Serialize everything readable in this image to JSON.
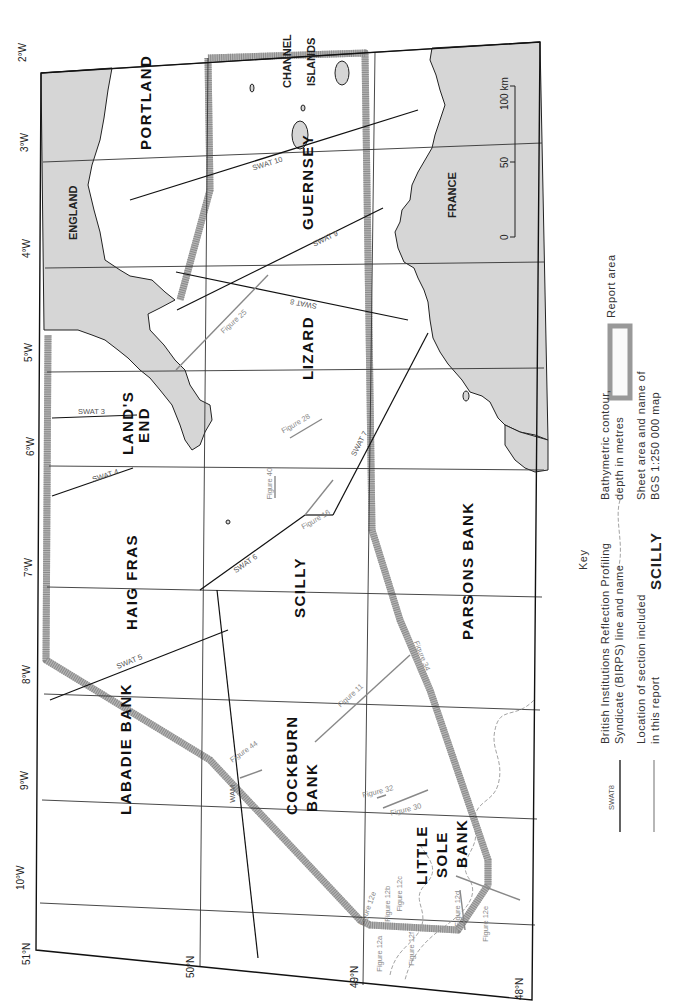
{
  "map": {
    "orientation": "rotated 90 degrees clockwise",
    "colors": {
      "land": "#d6d6d6",
      "report_area": "#b5b5b5",
      "swat_line": "#111111",
      "figure_line": "#888888",
      "contour": "#999999"
    },
    "longitude_ticks": [
      "2°W",
      "3°W",
      "4°W",
      "5°W",
      "6°W",
      "7°W",
      "8°W",
      "9°W",
      "10°W"
    ],
    "latitude_ticks": [
      "51°N",
      "50°N",
      "49°N",
      "48°N"
    ],
    "sheet_areas": [
      "PORTLAND",
      "GUERNSEY",
      "LIZARD",
      "LAND'S",
      "END",
      "HAIG FRAS",
      "SCILLY",
      "PARSONS BANK",
      "LABADIE BANK",
      "COCKBURN",
      "BANK",
      "LITTLE",
      "SOLE",
      "BANK"
    ],
    "land_labels": [
      "ENGLAND",
      "FRANCE",
      "CHANNEL",
      "ISLANDS"
    ],
    "swat_lines": [
      "SWAT 3",
      "SWAT 4",
      "SWAT 5",
      "SWAT 6",
      "SWAT 7",
      "SWAT 8",
      "SWAT 9",
      "SWAT 10",
      "WAM"
    ],
    "figure_lines": [
      "Figure 11",
      "Figure 12a",
      "Figure 12b",
      "Figure 12c",
      "Figure 12d",
      "Figure 12e",
      "Figure 12f",
      "Figure 16",
      "Figure 25",
      "Figure 27",
      "Figure 28",
      "Figure 30",
      "Figure 32",
      "Figure 34",
      "Figure 40",
      "Figure 44"
    ],
    "scale_bar": {
      "labels": [
        "0",
        "50",
        "100 km"
      ]
    }
  },
  "key": {
    "title": "Key",
    "report_area": "Report area",
    "bathymetric": [
      "Bathymetric contour,",
      "depth in metres"
    ],
    "sheet": {
      "sample": "SCILLY",
      "text": [
        "Sheet area and name of",
        "BGS 1:250 000 map"
      ]
    },
    "birps": {
      "sample": "SWAT8",
      "text": [
        "British Institutions Reflection Profiling",
        "Syndicate (BIRPS) line and name"
      ]
    },
    "section": {
      "text": [
        "Location of section included",
        "in this report"
      ]
    }
  }
}
